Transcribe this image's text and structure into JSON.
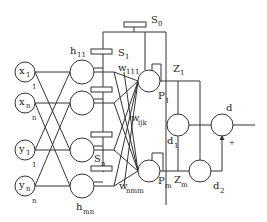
{
  "diagram": {
    "type": "neural network block diagram",
    "inputs": [
      {
        "main": "x",
        "sub": "1",
        "index": "1"
      },
      {
        "main": "x",
        "sub": "n",
        "index": "n"
      },
      {
        "main": "y",
        "sub": "1",
        "index": "1"
      },
      {
        "main": "y",
        "sub": "n",
        "index": "n"
      }
    ],
    "hidden_labels": {
      "top": {
        "main": "h",
        "sub": "11"
      },
      "bottom": {
        "main": "h",
        "sub": "mn"
      }
    },
    "switches": {
      "s0": {
        "main": "S",
        "sub": "0"
      },
      "s1": {
        "main": "S",
        "sub": "1"
      },
      "sn": {
        "main": "S",
        "sub": "n"
      }
    },
    "weights": {
      "w111": {
        "main": "w",
        "sub": "111"
      },
      "wijk": {
        "main": "w",
        "sub": "ijk"
      },
      "wnmm": {
        "main": "w",
        "sub": "nmm"
      }
    },
    "output_nodes": {
      "p1": {
        "main": "P",
        "sub": "1"
      },
      "pm": {
        "main": "P",
        "sub": "m"
      },
      "z1": {
        "main": "Z",
        "sub": "1"
      },
      "zm": {
        "main": "Z",
        "sub": "m"
      },
      "d1": {
        "main": "d",
        "sub": "1"
      },
      "d2": {
        "main": "d",
        "sub": "2"
      },
      "d": {
        "main": "d"
      },
      "plus": "+"
    }
  }
}
